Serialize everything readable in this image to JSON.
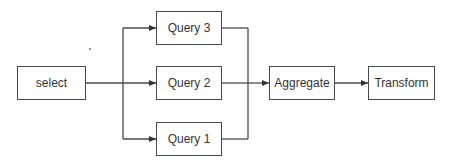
{
  "diagram": {
    "type": "flowchart",
    "direction": "left-to-right",
    "nodes": [
      {
        "id": "select",
        "label": "select"
      },
      {
        "id": "query3",
        "label": "Query 3"
      },
      {
        "id": "query2",
        "label": "Query 2"
      },
      {
        "id": "query1",
        "label": "Query 1"
      },
      {
        "id": "aggregate",
        "label": "Aggregate"
      },
      {
        "id": "transform",
        "label": "Transform"
      }
    ],
    "edges": [
      {
        "from": "select",
        "to": "query3"
      },
      {
        "from": "select",
        "to": "query2"
      },
      {
        "from": "select",
        "to": "query1"
      },
      {
        "from": "query3",
        "to": "aggregate"
      },
      {
        "from": "query2",
        "to": "aggregate"
      },
      {
        "from": "query1",
        "to": "aggregate"
      },
      {
        "from": "aggregate",
        "to": "transform"
      }
    ],
    "colors": {
      "stroke": "#4a4a4a",
      "text": "#333333",
      "background": "#ffffff"
    }
  }
}
